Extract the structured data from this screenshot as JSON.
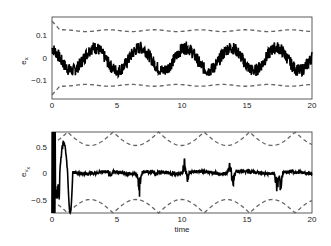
{
  "chart_data": [
    {
      "type": "line",
      "title": "",
      "xlabel": "",
      "ylabel": "e_x",
      "xlim": [
        0,
        20
      ],
      "ylim": [
        -0.18,
        0.18
      ],
      "xticks": [
        "0",
        "5",
        "10",
        "15",
        "20"
      ],
      "yticks": [
        "0.1",
        "0",
        "-0.1"
      ],
      "ytick_values": [
        0.1,
        0,
        -0.1
      ],
      "grid": false,
      "note": "Approximate: series values are visual estimates only; rendered curves are a synthetic approximation of the visible shape, not extracted data.",
      "series": [
        {
          "name": "e_x (error)",
          "style": "solid-black-noisy",
          "description": "Noisy oscillation, period ~3.5 time units, amplitude ~0.05, peaks near t=3.3, 6.8, 10.3, 13.8, 17.3",
          "x": [
            0,
            1,
            1.5,
            2,
            3.3,
            4.5,
            5,
            6.8,
            8,
            8.5,
            10.3,
            11.5,
            12,
            13.8,
            15,
            15.5,
            17.3,
            18.5,
            19,
            20
          ],
          "values": [
            0,
            -0.03,
            -0.07,
            -0.03,
            0.06,
            -0.02,
            -0.05,
            0.05,
            -0.05,
            -0.07,
            0.06,
            -0.02,
            -0.05,
            0.06,
            -0.04,
            -0.06,
            0.05,
            -0.05,
            -0.06,
            0.0
          ]
        },
        {
          "name": "upper bound",
          "style": "dashed-gray",
          "description": "Nearly constant ~0.12 with small bumps, starts higher near t=0",
          "x": [
            0,
            0.5,
            5,
            10,
            15,
            20
          ],
          "values": [
            0.16,
            0.12,
            0.12,
            0.12,
            0.12,
            0.12
          ]
        },
        {
          "name": "lower bound",
          "style": "dashed-gray",
          "description": "Nearly constant ~-0.12, starts lower near t=0",
          "x": [
            0,
            0.5,
            5,
            10,
            15,
            20
          ],
          "values": [
            -0.16,
            -0.12,
            -0.12,
            -0.12,
            -0.12,
            -0.12
          ]
        }
      ]
    },
    {
      "type": "line",
      "title": "",
      "xlabel": "time",
      "ylabel": "e_v_x",
      "xlim": [
        0,
        20
      ],
      "ylim": [
        -0.75,
        0.75
      ],
      "xticks": [
        "0",
        "5",
        "10",
        "15",
        "20"
      ],
      "yticks": [
        "0.5",
        "0",
        "-0.5"
      ],
      "ytick_values": [
        0.5,
        0,
        -0.5
      ],
      "grid": false,
      "note": "Approximate: series values are visual estimates only; rendered curves are a synthetic approximation of the visible shape, not extracted data.",
      "series": [
        {
          "name": "e_v_x (velocity error)",
          "style": "solid-black-noisy",
          "description": "Large initial transient (0 to 1.5) then near-zero with spikes at ~6.7, ~10.2, ~13.7, ~17.3",
          "x": [
            0,
            0.3,
            0.8,
            1.2,
            1.5,
            2,
            3,
            5,
            6.7,
            8,
            10.2,
            12,
            13.7,
            15,
            17.3,
            19,
            20
          ],
          "values": [
            0.75,
            -0.4,
            0.55,
            -0.75,
            0.05,
            0.05,
            -0.05,
            0.0,
            -0.45,
            0.05,
            0.25,
            0.0,
            -0.3,
            0.0,
            -0.4,
            0.0,
            0.05
          ]
        },
        {
          "name": "upper bound",
          "style": "dashed-gray",
          "description": "Periodic arcs dipping from ~0.75 to ~0.5, period ~3.5"
        },
        {
          "name": "lower bound",
          "style": "dashed-gray",
          "description": "Periodic arcs rising from ~-0.75 to ~-0.5, period ~3.5"
        }
      ]
    }
  ],
  "plots": {
    "top": {
      "ylabel_main": "e",
      "ylabel_sub": "x",
      "xticks": [
        "0",
        "5",
        "10",
        "15",
        "20"
      ],
      "yticks": [
        "0.1",
        "0",
        "−0.1"
      ]
    },
    "bottom": {
      "ylabel_main": "e",
      "ylabel_sub": "v",
      "ylabel_subsub": "x",
      "xlabel": "time",
      "xticks": [
        "0",
        "5",
        "10",
        "15",
        "20"
      ],
      "yticks": [
        "0.5",
        "0",
        "−0.5"
      ]
    }
  },
  "colors": {
    "signal": "#000000",
    "bound": "#666666",
    "axes": "#333333"
  }
}
